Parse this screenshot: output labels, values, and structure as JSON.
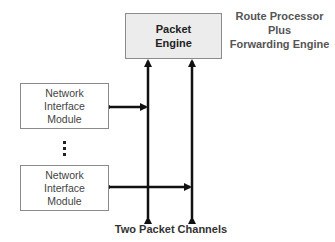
{
  "packet_engine": {
    "line1": "Packet",
    "line2": "Engine"
  },
  "route_processor_label": {
    "line1": "Route Processor",
    "line2": "Plus",
    "line3": "Forwarding Engine"
  },
  "nim_top": {
    "line1": "Network",
    "line2": "Interface",
    "line3": "Module"
  },
  "nim_bottom": {
    "line1": "Network",
    "line2": "Interface",
    "line3": "Module"
  },
  "ellipsis": "⋮",
  "channels_label": "Two Packet Channels",
  "colors": {
    "line": "#111111",
    "box_border": "#8a8a8a",
    "engine_fill": "#ececec"
  }
}
